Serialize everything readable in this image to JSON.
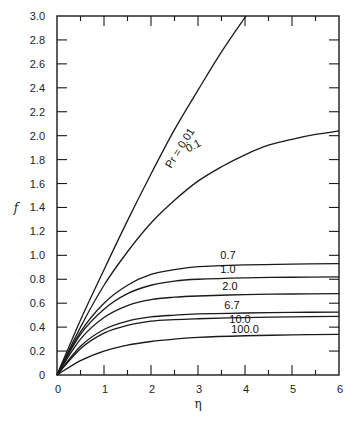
{
  "chart_data": {
    "type": "line",
    "title": "",
    "xlabel": "η",
    "ylabel": "f",
    "xlim": [
      0,
      6
    ],
    "ylim": [
      0,
      3.0
    ],
    "grid": false,
    "legend": "inline curve labels",
    "x_ticks": [
      0,
      1,
      2,
      3,
      4,
      5,
      6
    ],
    "x_tick_labels": [
      "0",
      "1",
      "2",
      "3",
      "4",
      "5",
      "6"
    ],
    "x_minor_ticks": [
      0.5,
      1.5,
      2.5,
      3.5,
      4.5,
      5.5
    ],
    "y_ticks": [
      0,
      0.2,
      0.4,
      0.6,
      0.8,
      1.0,
      1.2,
      1.4,
      1.6,
      1.8,
      2.0,
      2.2,
      2.4,
      2.6,
      2.8,
      3.0
    ],
    "y_tick_labels": [
      "0",
      "0.2",
      "0.4",
      "0.6",
      "0.8",
      "1.0",
      "1.2",
      "1.4",
      "1.6",
      "1.8",
      "2.0",
      "2.2",
      "2.4",
      "2.6",
      "2.8",
      "3.0"
    ],
    "series": [
      {
        "name": "Pr = 0.01",
        "label": "Pr = 0.01",
        "x": [
          0,
          0.5,
          1,
          1.5,
          2,
          2.5,
          3,
          3.5,
          4.02
        ],
        "y": [
          0,
          0.46,
          0.88,
          1.29,
          1.68,
          2.05,
          2.38,
          2.7,
          3.0
        ]
      },
      {
        "name": "0.1",
        "label": "0.1",
        "x": [
          0,
          0.5,
          1,
          1.5,
          2,
          2.5,
          3,
          3.5,
          4,
          4.5,
          5,
          5.5,
          6
        ],
        "y": [
          0,
          0.4,
          0.75,
          1.03,
          1.27,
          1.46,
          1.62,
          1.74,
          1.84,
          1.92,
          1.97,
          2.01,
          2.04
        ]
      },
      {
        "name": "0.7",
        "label": "0.7",
        "x": [
          0,
          0.5,
          1,
          1.5,
          2,
          2.5,
          3,
          4,
          5,
          6
        ],
        "y": [
          0,
          0.36,
          0.6,
          0.75,
          0.84,
          0.88,
          0.905,
          0.92,
          0.927,
          0.93
        ]
      },
      {
        "name": "1.0",
        "label": "1.0",
        "x": [
          0,
          0.5,
          1,
          1.5,
          2,
          2.5,
          3,
          4,
          5,
          6
        ],
        "y": [
          0,
          0.34,
          0.55,
          0.68,
          0.75,
          0.785,
          0.8,
          0.812,
          0.817,
          0.82
        ]
      },
      {
        "name": "2.0",
        "label": "2.0",
        "x": [
          0,
          0.5,
          1,
          1.5,
          2,
          2.5,
          3,
          4,
          5,
          6
        ],
        "y": [
          0,
          0.3,
          0.48,
          0.58,
          0.63,
          0.65,
          0.66,
          0.672,
          0.677,
          0.68
        ]
      },
      {
        "name": "6.7",
        "label": "6.7",
        "x": [
          0,
          0.5,
          1,
          1.5,
          2,
          2.5,
          3,
          4,
          5,
          6
        ],
        "y": [
          0,
          0.24,
          0.38,
          0.45,
          0.485,
          0.5,
          0.51,
          0.518,
          0.523,
          0.526
        ]
      },
      {
        "name": "10.0",
        "label": "10.0",
        "x": [
          0,
          0.5,
          1,
          1.5,
          2,
          2.5,
          3,
          4,
          5,
          6
        ],
        "y": [
          0,
          0.22,
          0.35,
          0.415,
          0.45,
          0.463,
          0.47,
          0.48,
          0.486,
          0.49
        ]
      },
      {
        "name": "100.0",
        "label": "100.0",
        "x": [
          0,
          0.5,
          1,
          1.5,
          2,
          2.5,
          3,
          4,
          5,
          6
        ],
        "y": [
          0,
          0.12,
          0.2,
          0.25,
          0.28,
          0.3,
          0.315,
          0.328,
          0.335,
          0.34
        ]
      }
    ]
  }
}
